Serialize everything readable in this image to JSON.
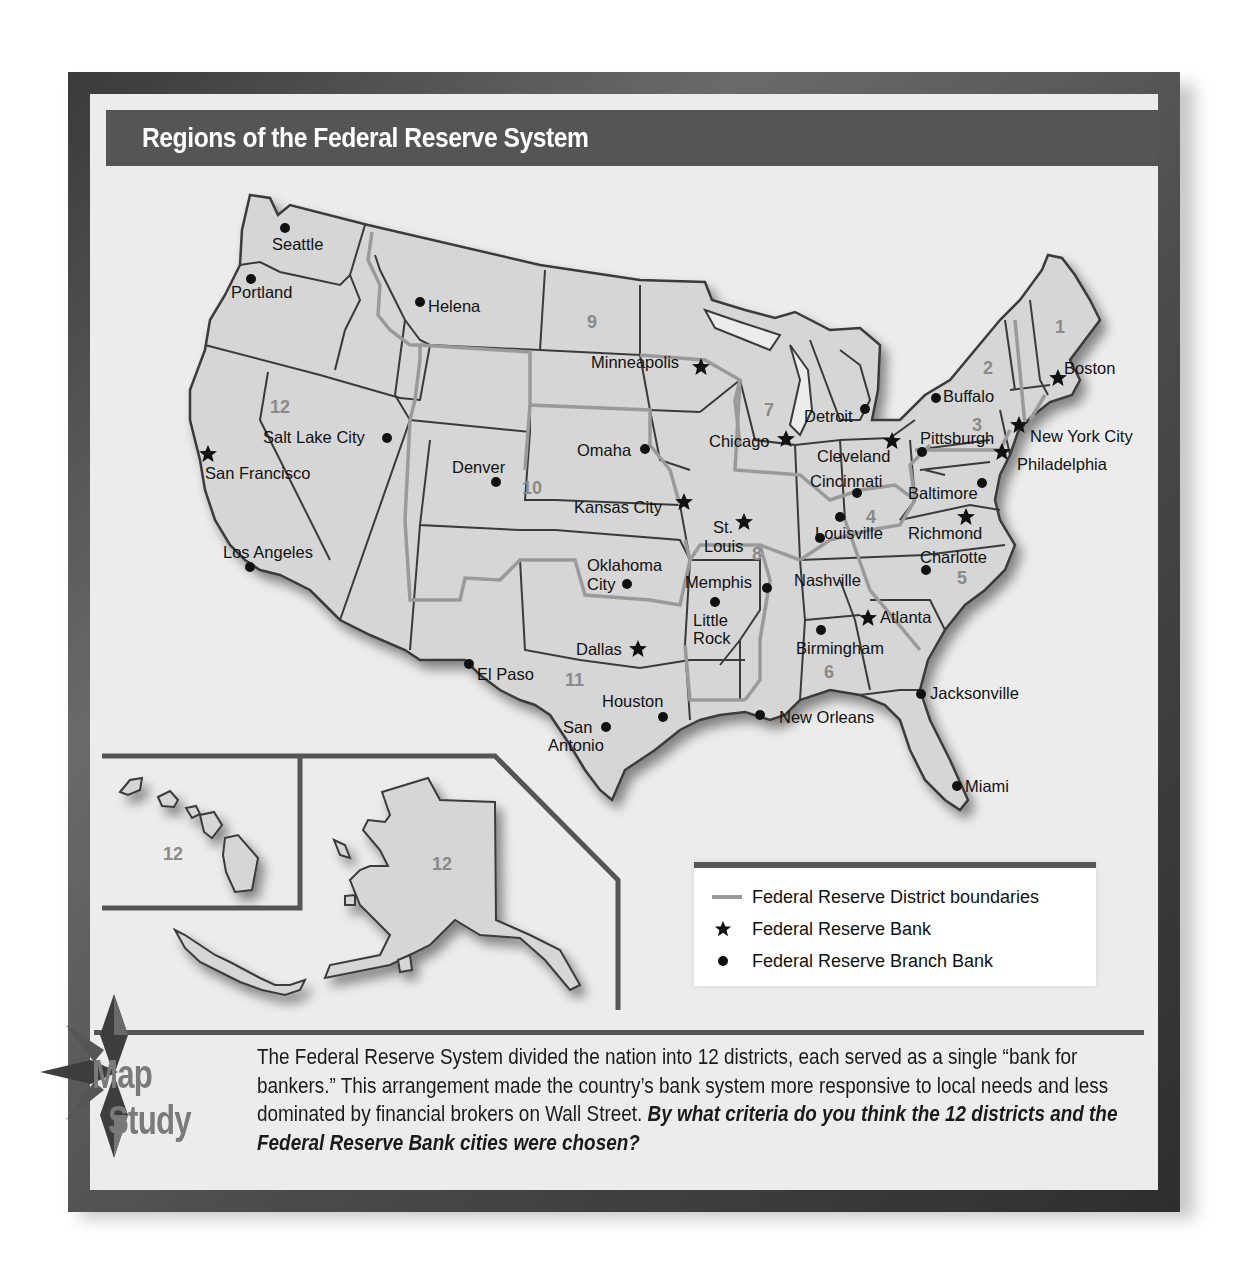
{
  "title": "Regions of the Federal Reserve System",
  "map": {
    "district_numbers": [
      {
        "label": "1",
        "x": 1062,
        "y": 333
      },
      {
        "label": "2",
        "x": 988,
        "y": 374
      },
      {
        "label": "3",
        "x": 978,
        "y": 431
      },
      {
        "label": "4",
        "x": 872,
        "y": 521
      },
      {
        "label": "5",
        "x": 963,
        "y": 582
      },
      {
        "label": "6",
        "x": 830,
        "y": 678
      },
      {
        "label": "7",
        "x": 770,
        "y": 415
      },
      {
        "label": "8",
        "x": 758,
        "y": 560
      },
      {
        "label": "9",
        "x": 593,
        "y": 328
      },
      {
        "label": "10",
        "x": 532,
        "y": 493
      },
      {
        "label": "11",
        "x": 575,
        "y": 685
      },
      {
        "label": "12",
        "x": 282,
        "y": 413
      }
    ],
    "reserve_banks": [
      {
        "name": "Boston",
        "mx": 1058,
        "my": 378,
        "lx": 1064,
        "ly": 374
      },
      {
        "name": "New York City",
        "mx": 1019,
        "my": 425,
        "lx": 1030,
        "ly": 442
      },
      {
        "name": "Philadelphia",
        "mx": 1002,
        "my": 452,
        "lx": 1017,
        "ly": 470
      },
      {
        "name": "Cleveland",
        "mx": 892,
        "my": 441,
        "lx": 817,
        "ly": 462
      },
      {
        "name": "Richmond",
        "mx": 966,
        "my": 517,
        "lx": 908,
        "ly": 539
      },
      {
        "name": "Atlanta",
        "mx": 868,
        "my": 618,
        "lx": 880,
        "ly": 623
      },
      {
        "name": "Chicago",
        "mx": 786,
        "my": 439,
        "lx": 709,
        "ly": 447
      },
      {
        "name": "St.",
        "mx": 744,
        "my": 522,
        "lx": 713,
        "ly": 533
      },
      {
        "name": "Louis",
        "mx": null,
        "my": null,
        "lx": 704,
        "ly": 552
      },
      {
        "name": "Minneapolis",
        "mx": 701,
        "my": 367,
        "lx": 591,
        "ly": 368
      },
      {
        "name": "Kansas City",
        "mx": 684,
        "my": 502,
        "lx": 574,
        "ly": 513
      },
      {
        "name": "Dallas",
        "mx": 638,
        "my": 649,
        "lx": 576,
        "ly": 655
      },
      {
        "name": "San Francisco",
        "mx": 208,
        "my": 454,
        "lx": 205,
        "ly": 479
      }
    ],
    "branch_banks": [
      {
        "name": "Seattle",
        "mx": 285,
        "my": 228,
        "lx": 272,
        "ly": 250
      },
      {
        "name": "Portland",
        "mx": 251,
        "my": 279,
        "lx": 231,
        "ly": 298
      },
      {
        "name": "Helena",
        "mx": 420,
        "my": 302,
        "lx": 428,
        "ly": 312
      },
      {
        "name": "Salt Lake City",
        "mx": 387,
        "my": 438,
        "lx": 263,
        "ly": 443
      },
      {
        "name": "Denver",
        "mx": 496,
        "my": 482,
        "lx": 452,
        "ly": 473
      },
      {
        "name": "Los Angeles",
        "mx": 250,
        "my": 567,
        "lx": 223,
        "ly": 558
      },
      {
        "name": "El Paso",
        "mx": 469,
        "my": 664,
        "lx": 477,
        "ly": 680
      },
      {
        "name": "Omaha",
        "mx": 645,
        "my": 449,
        "lx": 577,
        "ly": 456
      },
      {
        "name": "Oklahoma",
        "mx": null,
        "my": null,
        "lx": 587,
        "ly": 571
      },
      {
        "name": "City",
        "mx": 627,
        "my": 584,
        "lx": 587,
        "ly": 590
      },
      {
        "name": "Memphis",
        "mx": 767,
        "my": 588,
        "lx": 685,
        "ly": 588
      },
      {
        "name": "Little",
        "mx": 715,
        "my": 602,
        "lx": 693,
        "ly": 626
      },
      {
        "name": "Rock",
        "mx": null,
        "my": null,
        "lx": 693,
        "ly": 644
      },
      {
        "name": "Houston",
        "mx": 663,
        "my": 717,
        "lx": 602,
        "ly": 707
      },
      {
        "name": "San",
        "mx": 606,
        "my": 727,
        "lx": 563,
        "ly": 733
      },
      {
        "name": "Antonio",
        "mx": null,
        "my": null,
        "lx": 548,
        "ly": 751
      },
      {
        "name": "New Orleans",
        "mx": 760,
        "my": 715,
        "lx": 779,
        "ly": 723
      },
      {
        "name": "Birmingham",
        "mx": 821,
        "my": 630,
        "lx": 796,
        "ly": 654
      },
      {
        "name": "Nashville",
        "mx": 820,
        "my": 538,
        "lx": 794,
        "ly": 586
      },
      {
        "name": "Louisville",
        "mx": 840,
        "my": 517,
        "lx": 815,
        "ly": 539
      },
      {
        "name": "Cincinnati",
        "mx": 857,
        "my": 493,
        "lx": 810,
        "ly": 487
      },
      {
        "name": "Detroit",
        "mx": 865,
        "my": 409,
        "lx": 804,
        "ly": 422
      },
      {
        "name": "Pittsburgh",
        "mx": 922,
        "my": 452,
        "lx": 920,
        "ly": 444
      },
      {
        "name": "Buffalo",
        "mx": 936,
        "my": 398,
        "lx": 943,
        "ly": 402
      },
      {
        "name": "Baltimore",
        "mx": 982,
        "my": 483,
        "lx": 908,
        "ly": 499
      },
      {
        "name": "Charlotte",
        "mx": 926,
        "my": 570,
        "lx": 920,
        "ly": 563
      },
      {
        "name": "Jacksonville",
        "mx": 921,
        "my": 694,
        "lx": 930,
        "ly": 699
      },
      {
        "name": "Miami",
        "mx": 957,
        "my": 786,
        "lx": 965,
        "ly": 792
      }
    ],
    "inset_labels": [
      {
        "label": "12",
        "x": 165,
        "y": 860
      },
      {
        "label": "12",
        "x": 442,
        "y": 870
      }
    ]
  },
  "legend": {
    "items": [
      {
        "symbol": "district-line",
        "label": "Federal Reserve District boundaries"
      },
      {
        "symbol": "star",
        "label": "Federal Reserve Bank"
      },
      {
        "symbol": "dot",
        "label": "Federal Reserve Branch Bank"
      }
    ]
  },
  "map_study": {
    "badge_top": "Map",
    "badge_bottom": "Study",
    "text_plain": "The Federal Reserve System divided the nation into 12 districts, each served as a single “bank for bankers.” This arrangement made the country’s bank system more responsive to local needs and less dominated by financial brokers on Wall Street. ",
    "question": "By what criteria do you think the 12 districts and the Federal Reserve Bank cities were chosen?"
  },
  "colors": {
    "frame": "#4a4a4a",
    "title_bar": "#555555",
    "land": "#d6d6d6",
    "state_border": "#3a3a3a",
    "district_border": "#9a9a9a",
    "background": "#ececec"
  }
}
